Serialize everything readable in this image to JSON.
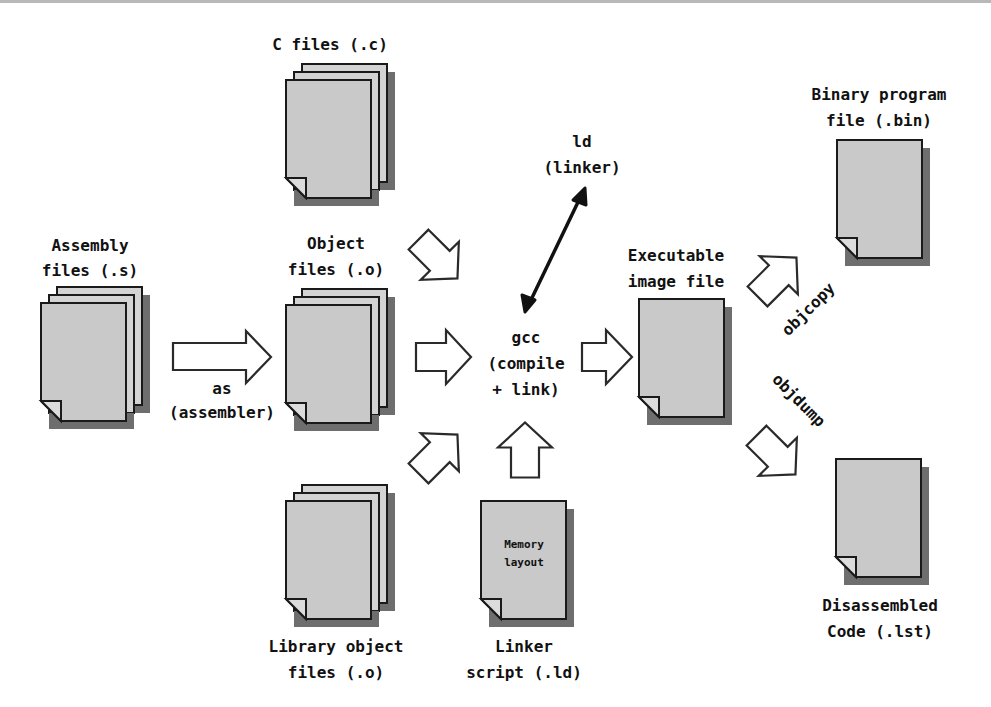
{
  "diagram": {
    "nodes": {
      "c_files": {
        "line1": "C files (.c)"
      },
      "assembly_files": {
        "line1": "Assembly",
        "line2": "files (.s)"
      },
      "object_files": {
        "line1": "Object",
        "line2": "files (.o)"
      },
      "library_object_files": {
        "line1": "Library object",
        "line2": "files (.o)"
      },
      "linker_script": {
        "line1": "Linker",
        "line2": "script (.ld)",
        "inner_line1": "Memory",
        "inner_line2": "layout"
      },
      "gcc": {
        "line1": "gcc",
        "line2": "(compile",
        "line3": "+ link)"
      },
      "ld": {
        "line1": "ld",
        "line2": "(linker)"
      },
      "executable": {
        "line1": "Executable",
        "line2": "image file"
      },
      "binary": {
        "line1": "Binary program",
        "line2": "file (.bin)"
      },
      "disassembled": {
        "line1": "Disassembled",
        "line2": "Code (.lst)"
      }
    },
    "edges": {
      "as": {
        "line1": "as",
        "line2": "(assembler)"
      },
      "objcopy": {
        "label": "objcopy"
      },
      "objdump": {
        "label": "objdump"
      }
    },
    "colors": {
      "page_fill": "#c9c9c9",
      "page_shadow": "#6e6e6e",
      "outline": "#1a1a1a",
      "background": "#ffffff"
    }
  }
}
